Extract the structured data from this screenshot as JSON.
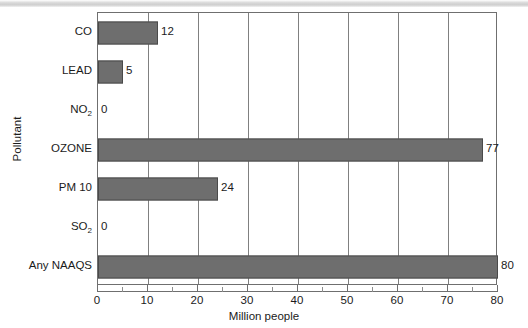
{
  "chart_data": {
    "type": "bar",
    "orientation": "horizontal",
    "title": "",
    "xlabel": "Million people",
    "ylabel": "Pollutant",
    "categories": [
      "CO",
      "LEAD",
      "NO2",
      "OZONE",
      "PM 10",
      "SO2",
      "Any NAAQS"
    ],
    "category_labels_html": [
      "CO",
      "LEAD",
      "NO<sub>2</sub>",
      "OZONE",
      "PM 10",
      "SO<sub>2</sub>",
      "Any NAAQS"
    ],
    "values": [
      12,
      5,
      0,
      77,
      24,
      0,
      80
    ],
    "data_labels": [
      "12",
      "5",
      "0",
      "77",
      "24",
      "0",
      "80"
    ],
    "xlim": [
      0,
      80
    ],
    "xticks": [
      0,
      10,
      20,
      30,
      40,
      50,
      60,
      70,
      80
    ],
    "xtick_labels": [
      "0",
      "10",
      "20",
      "30",
      "40",
      "50",
      "60",
      "70",
      "80"
    ],
    "xminor_ticks": [
      5,
      15,
      25,
      35,
      45,
      55,
      65,
      75
    ],
    "grid": "vertical-major",
    "legend": "none",
    "bar_color": "#6e6e6e",
    "bar_edge_color": "#4a4a4a",
    "axis_color": "#6f6f6f",
    "gridline_color": "#808080",
    "background_color": "#ffffff",
    "text_color": "#1b1b1b"
  }
}
